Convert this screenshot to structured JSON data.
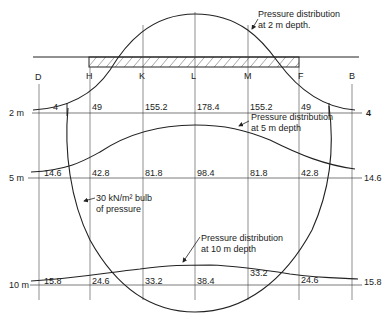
{
  "points": {
    "D": "D",
    "H": "H",
    "K": "K",
    "L": "L",
    "M": "M",
    "F": "F",
    "B": "B"
  },
  "depths": {
    "d2": "2 m",
    "d5": "5 m",
    "d10": "10 m"
  },
  "values_2m": [
    "4",
    "49",
    "155.2",
    "178.4",
    "155.2",
    "49",
    "4"
  ],
  "values_5m": [
    "14.6",
    "42.8",
    "81.8",
    "98.4",
    "81.8",
    "42.8",
    "14.6"
  ],
  "values_10m": [
    "15.8",
    "24.6",
    "33.2",
    "38.4",
    "33.2",
    "24.6",
    "15.8"
  ],
  "annotations": {
    "p2_line1": "Pressure distribution",
    "p2_line2": "at 2 m depth.",
    "p5_line1": "Pressure distribution",
    "p5_line2": "at 5 m depth",
    "p10_line1": "Pressure distribution",
    "p10_line2": "at 10 m depth",
    "bulb_line1": "30 kN/m² bulb",
    "bulb_line2": "of pressure"
  },
  "colors": {
    "ink": "#222222",
    "background": "#ffffff"
  }
}
